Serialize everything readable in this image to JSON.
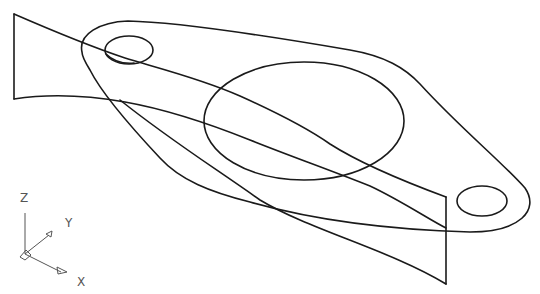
{
  "drawing": {
    "type": "isometric wireframe",
    "subject": "flange plate with two bolt holes and central bore, intersected by a twisted surface",
    "line_color": "#1a1a1a",
    "background": "#ffffff"
  },
  "ucs_icon": {
    "axes": [
      {
        "name": "z",
        "label": "Z"
      },
      {
        "name": "y",
        "label": "Y"
      },
      {
        "name": "x",
        "label": "X"
      }
    ],
    "color": "#555555"
  }
}
